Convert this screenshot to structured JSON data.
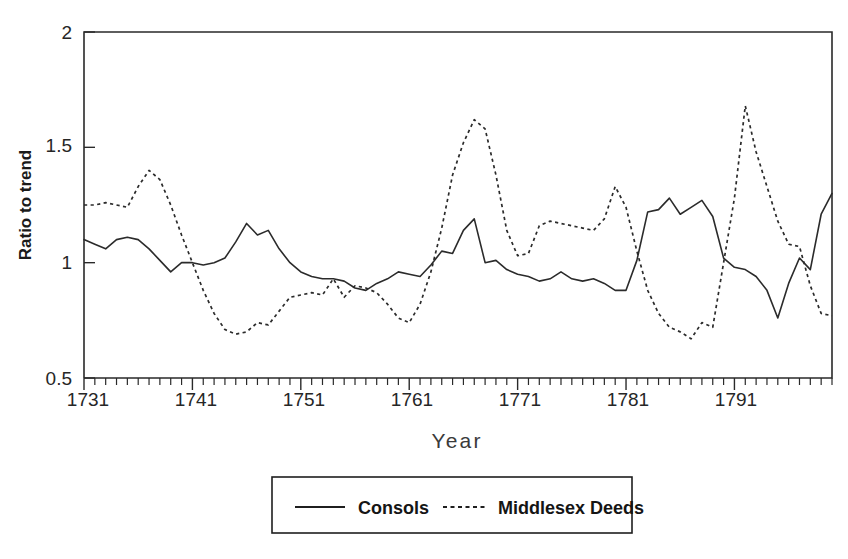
{
  "chart_data": {
    "type": "line",
    "title": "",
    "xlabel": "Year",
    "ylabel": "Ratio to trend",
    "xlim": [
      1731,
      1800
    ],
    "ylim": [
      0.5,
      2
    ],
    "x_tick_labels": [
      "1731",
      "1741",
      "1751",
      "1761",
      "1771",
      "1781",
      "1791"
    ],
    "x_major_ticks": [
      1731,
      1741,
      1751,
      1761,
      1771,
      1781,
      1791
    ],
    "x_minor_tick_interval": 1,
    "y_tick_labels": [
      "0.5",
      "1",
      "1.5",
      "2"
    ],
    "y_ticks": [
      0.5,
      1,
      1.5,
      2
    ],
    "grid": false,
    "legend_position": "below-center",
    "legend_entries": [
      {
        "label": "Consols",
        "style": "solid"
      },
      {
        "label": "Middlesex Deeds",
        "style": "dashed"
      }
    ],
    "x": [
      1731,
      1732,
      1733,
      1734,
      1735,
      1736,
      1737,
      1738,
      1739,
      1740,
      1741,
      1742,
      1743,
      1744,
      1745,
      1746,
      1747,
      1748,
      1749,
      1750,
      1751,
      1752,
      1753,
      1754,
      1755,
      1756,
      1757,
      1758,
      1759,
      1760,
      1761,
      1762,
      1763,
      1764,
      1765,
      1766,
      1767,
      1768,
      1769,
      1770,
      1771,
      1772,
      1773,
      1774,
      1775,
      1776,
      1777,
      1778,
      1779,
      1780,
      1781,
      1782,
      1783,
      1784,
      1785,
      1786,
      1787,
      1788,
      1789,
      1790,
      1791,
      1792,
      1793,
      1794,
      1795,
      1796,
      1797,
      1798,
      1799,
      1800
    ],
    "series": [
      {
        "name": "Consols",
        "style": "solid",
        "values": [
          1.1,
          1.08,
          1.06,
          1.1,
          1.11,
          1.1,
          1.06,
          1.01,
          0.96,
          1.0,
          1.0,
          0.99,
          1.0,
          1.02,
          1.09,
          1.17,
          1.12,
          1.14,
          1.06,
          1.0,
          0.96,
          0.94,
          0.93,
          0.93,
          0.92,
          0.89,
          0.88,
          0.91,
          0.93,
          0.96,
          0.95,
          0.94,
          0.99,
          1.05,
          1.04,
          1.14,
          1.19,
          1.0,
          1.01,
          0.97,
          0.95,
          0.94,
          0.92,
          0.93,
          0.96,
          0.93,
          0.92,
          0.93,
          0.91,
          0.88,
          0.88,
          1.01,
          1.22,
          1.23,
          1.28,
          1.21,
          1.24,
          1.27,
          1.2,
          1.02,
          0.98,
          0.97,
          0.94,
          0.88,
          0.76,
          0.91,
          1.02,
          0.97,
          1.21,
          1.3
        ]
      },
      {
        "name": "Middlesex Deeds",
        "style": "dashed",
        "values": [
          1.25,
          1.25,
          1.26,
          1.25,
          1.24,
          1.33,
          1.4,
          1.36,
          1.25,
          1.12,
          1.0,
          0.88,
          0.78,
          0.71,
          0.69,
          0.7,
          0.74,
          0.73,
          0.79,
          0.85,
          0.86,
          0.87,
          0.86,
          0.93,
          0.85,
          0.9,
          0.89,
          0.87,
          0.82,
          0.76,
          0.74,
          0.82,
          0.96,
          1.15,
          1.38,
          1.52,
          1.62,
          1.58,
          1.38,
          1.14,
          1.03,
          1.04,
          1.16,
          1.18,
          1.17,
          1.16,
          1.15,
          1.14,
          1.19,
          1.33,
          1.24,
          1.05,
          0.88,
          0.78,
          0.72,
          0.7,
          0.67,
          0.74,
          0.72,
          1.0,
          1.28,
          1.68,
          1.48,
          1.33,
          1.18,
          1.08,
          1.07,
          0.9,
          0.78,
          0.77
        ]
      }
    ]
  },
  "axes": {
    "y_title": "Ratio to trend",
    "x_title": "Year"
  },
  "legend": {
    "consols_label": "Consols",
    "deeds_label": "Middlesex Deeds"
  },
  "y_tick_texts": {
    "t0": "0.5",
    "t1": "1",
    "t2": "1.5",
    "t3": "2"
  },
  "x_tick_texts": {
    "t0": "1731",
    "t1": "1741",
    "t2": "1751",
    "t3": "1761",
    "t4": "1771",
    "t5": "1781",
    "t6": "1791"
  },
  "colors": {
    "line": "#2b2b2b",
    "axis": "#2a2a2a",
    "background": "#ffffff"
  }
}
